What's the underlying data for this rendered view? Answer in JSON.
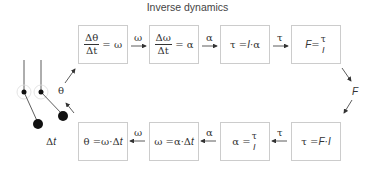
{
  "title": "Inverse dynamics",
  "top_row": [
    {
      "id": "theta-to-omega",
      "num": "Δθ",
      "den": "Δt",
      "rhs": "= ω"
    },
    {
      "id": "omega-to-alpha",
      "num": "Δω",
      "den": "Δt",
      "rhs": "= α"
    },
    {
      "id": "torque",
      "lhs": "τ = ",
      "mid": "I",
      "rhs": "·α"
    },
    {
      "id": "force",
      "lhs": "F",
      "eq": " = ",
      "num": "τ",
      "den": "I"
    }
  ],
  "top_arrows": [
    "ω",
    "α",
    "τ"
  ],
  "bottom_row": [
    {
      "id": "theta",
      "text": "θ =ω·Δ",
      "var": "t"
    },
    {
      "id": "omega",
      "text": "ω =α·Δ",
      "var": "t"
    },
    {
      "id": "alpha",
      "lhs": "α = ",
      "num": "τ",
      "den": "I"
    },
    {
      "id": "torque-from-force",
      "lhs": "τ = ",
      "var": "F·I"
    }
  ],
  "bottom_arrows": [
    "ω",
    "α",
    "τ"
  ],
  "side_labels": {
    "theta": "θ",
    "force": "F",
    "delta_t_prefix": "Δ",
    "delta_t_var": "t"
  },
  "colors": {
    "box_border": "#cccccc",
    "line": "#333333",
    "text": "#333333"
  }
}
